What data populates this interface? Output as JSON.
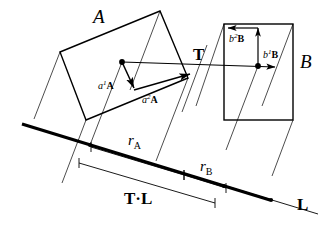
{
  "figure": {
    "background_color": "#ffffff",
    "stroke_color": "#000000",
    "labels": {
      "box_a": "A",
      "box_b": "B",
      "translation": "T",
      "axis_line": "L",
      "projection_t_dot_l": "T·L",
      "radius_a": "r",
      "radius_a_sub": "A",
      "radius_b": "r",
      "radius_b_sub": "B",
      "a_axis1_coef": "a",
      "a_axis1_sup": "1",
      "a_axis1_vec": "A",
      "a_axis2_coef": "a",
      "a_axis2_sup": "2",
      "a_axis2_vec": "A",
      "b_axis1_coef": "b",
      "b_axis1_sup": "1",
      "b_axis1_vec": "B",
      "b_axis2_coef": "b",
      "b_axis2_sup": "2",
      "b_axis2_vec": "B"
    },
    "geometry": {
      "box_a_polygon": "60,52 160,11 188,78 86,120",
      "box_b_rect": {
        "x": 224,
        "y": 24,
        "width": 69,
        "height": 96
      },
      "axis_line_L": {
        "x1": 22,
        "y1": 124,
        "x2": 318,
        "y2": 214
      },
      "axis_line_L_thick": {
        "x1": 22,
        "y1": 124,
        "x2": 270,
        "y2": 200
      },
      "center_a": {
        "x": 122,
        "y": 62
      },
      "center_b": {
        "x": 258,
        "y": 66
      },
      "corner_a": {
        "x": 188,
        "y": 78
      },
      "projection_ticks": [
        {
          "x": 90,
          "y": 145
        },
        {
          "x": 182,
          "y": 173
        },
        {
          "x": 207,
          "y": 181
        }
      ]
    }
  }
}
